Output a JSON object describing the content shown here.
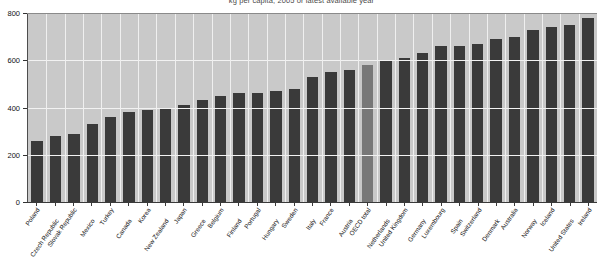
{
  "chart_data": {
    "type": "bar",
    "title": "kg per capita, 2005 or latest available year",
    "xlabel": "",
    "ylabel": "",
    "ylim": [
      0,
      800
    ],
    "yticks": [
      0,
      200,
      400,
      600,
      800
    ],
    "ytick_labels": [
      "0",
      "200",
      "400",
      "600",
      "800"
    ],
    "grid": true,
    "legend": false,
    "highlight_category": "OECD total",
    "highlight_color": "#787878",
    "bar_color": "#3a3a3a",
    "plot_background": "#c9c9c9",
    "categories": [
      "Poland",
      "Czech Republic",
      "Slovak Republic",
      "Mexico",
      "Turkey",
      "Canada",
      "Korea",
      "New Zealand",
      "Japan",
      "Greece",
      "Belgium",
      "Finland",
      "Portugal",
      "Hungary",
      "Sweden",
      "Italy",
      "France",
      "Austria",
      "OECD total",
      "Netherlands",
      "United Kingdom",
      "Germany",
      "Luxembourg",
      "Spain",
      "Switzerland",
      "Denmark",
      "Australia",
      "Norway",
      "Iceland",
      "United States",
      "Ireland"
    ],
    "values": [
      260,
      280,
      290,
      330,
      360,
      380,
      390,
      400,
      410,
      430,
      450,
      460,
      460,
      470,
      480,
      530,
      550,
      560,
      580,
      600,
      610,
      630,
      660,
      660,
      670,
      690,
      700,
      730,
      740,
      750,
      780
    ]
  }
}
